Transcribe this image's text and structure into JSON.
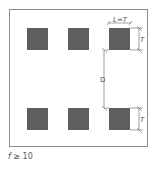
{
  "diagram": {
    "square_color": "#5e5e5e",
    "line_color": "#7a7a7a",
    "frame_color": "#8c8c8c",
    "squares": [
      {
        "x": 27,
        "y": 28,
        "w": 21,
        "h": 22
      },
      {
        "x": 68,
        "y": 28,
        "w": 21,
        "h": 22
      },
      {
        "x": 109,
        "y": 28,
        "w": 21,
        "h": 22
      },
      {
        "x": 27,
        "y": 108,
        "w": 21,
        "h": 22
      },
      {
        "x": 68,
        "y": 108,
        "w": 21,
        "h": 22
      },
      {
        "x": 109,
        "y": 108,
        "w": 21,
        "h": 22
      }
    ],
    "labels": {
      "width_label": "L=T",
      "height_label_top": "T",
      "spacing_label": "D",
      "height_label_bottom": "T"
    }
  },
  "caption": {
    "variable": "f",
    "relation": " ≥ 10"
  }
}
